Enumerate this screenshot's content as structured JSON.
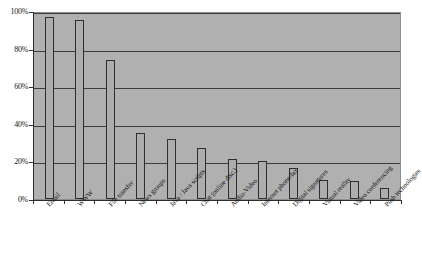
{
  "chart_data": {
    "type": "bar",
    "title": "",
    "subtitle": "",
    "xlabel": "",
    "ylabel": "",
    "ylim": [
      0,
      100
    ],
    "grid": true,
    "legend": false,
    "y_tick_labels": [
      "100%",
      "80%",
      "60%",
      "40%",
      "20%",
      "0%"
    ],
    "y_ticks": [
      100,
      80,
      60,
      40,
      20,
      0
    ],
    "categories": [
      "Email",
      "WWW",
      "File transfer",
      "News groups",
      "Java / Java scripts",
      "Chat (online disc.)",
      "Audio-Video",
      "Internet phone/fax",
      "Digital signatures",
      "Virtual reality",
      "Video conferencing",
      "Push technologies"
    ],
    "values": [
      97,
      95,
      74,
      35,
      32,
      27,
      21.5,
      20,
      16.5,
      10,
      9.5,
      6
    ],
    "value_labels": [
      "97%",
      "95%",
      "74%",
      "35%",
      "32%",
      "27%",
      "22%",
      "20%",
      "17%",
      "10%",
      "10%",
      "6%"
    ],
    "colors": {
      "plot_background": "#b0b0b0",
      "bar_fill": "#adadad",
      "bar_border": "#2f2f2f",
      "gridline": "#3c3c3c",
      "axis": "#2f2f2f",
      "text": "#161616",
      "page_background": "#ffffff"
    }
  }
}
